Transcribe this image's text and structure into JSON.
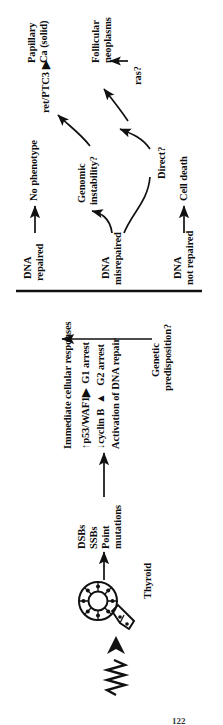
{
  "figure": {
    "type": "flow-diagram",
    "orientation_note": "scanned page rotated 90 degrees counter-clockwise",
    "page_number": "122"
  },
  "nodes": {
    "radiation": "radiation-waveform-icon",
    "thyroid_label": "Thyroid",
    "damage": {
      "line1": "DSBs",
      "line2": "SSBs",
      "line3": "Point",
      "line4": "mutations"
    },
    "responses": {
      "heading": "Immediate cellular responses",
      "row1": "↑p53/WAF1▶  G1 arrest",
      "row2": "↓cyclin B  ▲   G2 arrest",
      "row3": "Activation of DNA repair"
    },
    "predisposition": {
      "line1": "Genetic",
      "line2": "predisposition?"
    },
    "outcomes": {
      "repaired": {
        "line1": "DNA",
        "line2": "repaired"
      },
      "misrepaired": {
        "line1": "DNA",
        "line2": "misrepaired"
      },
      "not_repaired": {
        "line1": "DNA",
        "line2": "not repaired"
      }
    },
    "results": {
      "no_phenotype": "No phenotype",
      "genomic_instability": {
        "line1": "Genomic",
        "line2": "instability?"
      },
      "direct": "Direct?",
      "cell_death": "Cell death"
    },
    "oncogenes": {
      "ret_ptc3": "ret/PTC3 ▶",
      "ras": "ras?"
    },
    "tumors": {
      "papillary": {
        "line1": "Papillary",
        "line2": "Ca (solid)"
      },
      "follicular": {
        "line1": "Follicular",
        "line2": "neoplasms"
      }
    }
  },
  "colors": {
    "ink": "#111111",
    "background": "#ffffff"
  }
}
